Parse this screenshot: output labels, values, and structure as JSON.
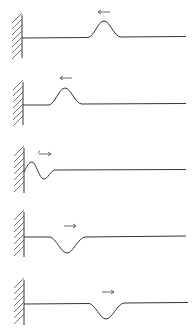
{
  "diagram": {
    "colors": {
      "line": "#333333",
      "background": "#ffffff"
    },
    "panels": [
      {
        "index": 1,
        "pulse": "crest",
        "pulse_x": 105,
        "direction": "left",
        "arrow_icon": "arrow-left",
        "baseline_y": 38
      },
      {
        "index": 2,
        "pulse": "crest",
        "pulse_x": 65,
        "direction": "left",
        "arrow_icon": "arrow-left",
        "baseline_y": 105
      },
      {
        "index": 3,
        "pulse": "reflecting",
        "pulse_x": 35,
        "direction": "reversing",
        "arrow_icon": "hooked-arrow-right",
        "baseline_y": 170
      },
      {
        "index": 4,
        "pulse": "trough",
        "pulse_x": 67,
        "direction": "right",
        "arrow_icon": "arrow-right",
        "baseline_y": 237
      },
      {
        "index": 5,
        "pulse": "trough",
        "pulse_x": 106,
        "direction": "right",
        "arrow_icon": "arrow-right",
        "baseline_y": 303
      }
    ]
  }
}
